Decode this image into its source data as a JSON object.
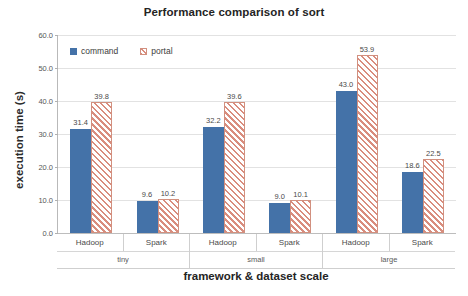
{
  "chart_data": {
    "type": "bar",
    "title": "Performance comparison of sort",
    "xlabel": "framework & dataset scale",
    "ylabel": "execution time (s)",
    "ylim": [
      0,
      60
    ],
    "y_ticks": [
      "0.0",
      "10.0",
      "20.0",
      "30.0",
      "40.0",
      "50.0",
      "60.0"
    ],
    "y_tick_values": [
      0,
      10,
      20,
      30,
      40,
      50,
      60
    ],
    "grid": true,
    "legend_position": "top-left inside plot",
    "categories": [
      "Hadoop",
      "Spark",
      "Hadoop",
      "Spark",
      "Hadoop",
      "Spark"
    ],
    "group_labels": [
      "tiny",
      "small",
      "large"
    ],
    "series": [
      {
        "name": "command",
        "color": "#4472a8",
        "values": [
          31.4,
          9.6,
          32.2,
          9.0,
          43.0,
          18.6
        ],
        "value_labels": [
          "31.4",
          "9.6",
          "32.2",
          "9.0",
          "43.0",
          "18.6"
        ]
      },
      {
        "name": "portal",
        "color": "#d98d7e",
        "pattern": "diagonal-hatch",
        "values": [
          39.8,
          10.2,
          39.6,
          10.1,
          53.9,
          22.5
        ],
        "value_labels": [
          "39.8",
          "10.2",
          "39.6",
          "10.1",
          "53.9",
          "22.5"
        ]
      }
    ],
    "groups": [
      {
        "scale": "tiny",
        "frameworks": [
          {
            "name": "Hadoop",
            "command": 31.4,
            "portal": 39.8
          },
          {
            "name": "Spark",
            "command": 9.6,
            "portal": 10.2
          }
        ]
      },
      {
        "scale": "small",
        "frameworks": [
          {
            "name": "Hadoop",
            "command": 32.2,
            "portal": 39.6
          },
          {
            "name": "Spark",
            "command": 9.0,
            "portal": 10.1
          }
        ]
      },
      {
        "scale": "large",
        "frameworks": [
          {
            "name": "Hadoop",
            "command": 43.0,
            "portal": 53.9
          },
          {
            "name": "Spark",
            "command": 18.6,
            "portal": 22.5
          }
        ]
      }
    ]
  }
}
